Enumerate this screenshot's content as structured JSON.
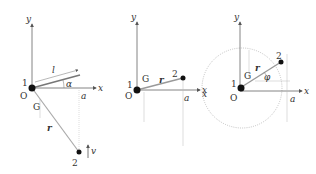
{
  "panels": [
    {
      "id": "panel-1",
      "labels": {
        "y_axis": "y",
        "x_axis": "x",
        "origin": "O",
        "mass1": "1",
        "mass2": "2",
        "G": "G",
        "length": "l",
        "angle": "α",
        "a": "a",
        "r": "r",
        "velocity": "v"
      }
    },
    {
      "id": "panel-2",
      "labels": {
        "y_axis": "y",
        "x_axis": "x",
        "origin": "O",
        "mass1": "1",
        "mass2": "2",
        "G": "G",
        "a": "a",
        "r": "r"
      }
    },
    {
      "id": "panel-3",
      "labels": {
        "y_axis": "y",
        "x_axis": "x",
        "x_left": "x",
        "origin": "O",
        "mass1": "1",
        "mass2": "2",
        "G": "G",
        "a": "a",
        "r": "r",
        "angle": "φ"
      }
    }
  ],
  "colors": {
    "axis": "#555555",
    "guide": "#aaaaaa",
    "rod": "#888888",
    "dot": "#111111",
    "text": "#333333"
  }
}
